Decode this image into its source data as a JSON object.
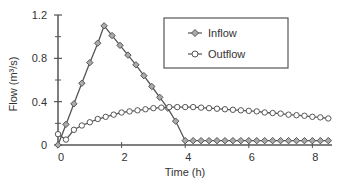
{
  "chart_data": {
    "type": "line",
    "title": "",
    "xlabel": "Time (h)",
    "ylabel": "Flow  (m³/s)",
    "xlim": [
      0,
      8.6
    ],
    "ylim": [
      0,
      1.2
    ],
    "xticks": [
      0,
      2,
      4,
      6,
      8
    ],
    "xtick_labels": [
      "0",
      "2",
      "4",
      "6",
      "8"
    ],
    "yticks": [
      0,
      0.4,
      0.8,
      1.2
    ],
    "ytick_labels": [
      "0",
      "0.4",
      "0.8",
      "1.2"
    ],
    "yminor_ticks": [
      0.2,
      0.6,
      1.0
    ],
    "grid": false,
    "legend_position": "top-right",
    "series": [
      {
        "name": "Inflow",
        "marker": "diamond",
        "color": "#555555",
        "x": [
          0,
          0.25,
          0.5,
          0.75,
          1.0,
          1.25,
          1.45,
          1.7,
          1.95,
          2.2,
          2.45,
          2.7,
          2.95,
          3.2,
          3.45,
          3.7,
          4.0,
          4.25,
          4.5,
          4.75,
          5.0,
          5.25,
          5.5,
          5.75,
          6.0,
          6.25,
          6.5,
          6.75,
          7.0,
          7.25,
          7.5,
          7.75,
          8.0,
          8.25,
          8.5
        ],
        "y": [
          0,
          0.19,
          0.38,
          0.57,
          0.76,
          0.94,
          1.1,
          1.01,
          0.92,
          0.83,
          0.74,
          0.64,
          0.54,
          0.44,
          0.34,
          0.22,
          0.04,
          0.04,
          0.04,
          0.04,
          0.04,
          0.04,
          0.04,
          0.04,
          0.04,
          0.04,
          0.04,
          0.04,
          0.04,
          0.04,
          0.04,
          0.04,
          0.04,
          0.04,
          0.04
        ]
      },
      {
        "name": "Outflow",
        "marker": "circle",
        "color": "#555555",
        "x": [
          0,
          0.25,
          0.5,
          0.75,
          1.0,
          1.25,
          1.5,
          1.75,
          2.0,
          2.25,
          2.5,
          2.75,
          3.0,
          3.25,
          3.5,
          3.75,
          4.0,
          4.25,
          4.5,
          4.75,
          5.0,
          5.25,
          5.5,
          5.75,
          6.0,
          6.25,
          6.5,
          6.75,
          7.0,
          7.25,
          7.5,
          7.75,
          8.0,
          8.25,
          8.5
        ],
        "y": [
          0.1,
          0.05,
          0.14,
          0.18,
          0.21,
          0.24,
          0.26,
          0.28,
          0.3,
          0.31,
          0.32,
          0.33,
          0.34,
          0.345,
          0.35,
          0.35,
          0.35,
          0.35,
          0.345,
          0.34,
          0.335,
          0.33,
          0.325,
          0.32,
          0.315,
          0.31,
          0.3,
          0.295,
          0.29,
          0.28,
          0.275,
          0.27,
          0.26,
          0.255,
          0.245
        ]
      }
    ]
  }
}
